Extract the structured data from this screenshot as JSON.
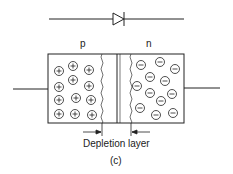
{
  "diagram": {
    "symbol": "diode-symbol",
    "regions": {
      "p_label": "p",
      "n_label": "n"
    },
    "p_charge_symbol": "+",
    "n_charge_symbol": "−",
    "depletion_label": "Depletion layer",
    "caption": "(c)",
    "colors": {
      "stroke": "#222222",
      "background": "#ffffff"
    }
  }
}
